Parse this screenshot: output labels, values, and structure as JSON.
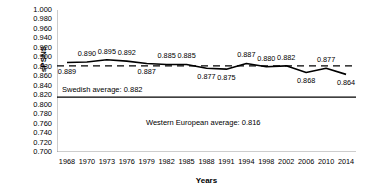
{
  "chart_data": {
    "type": "line",
    "title": "",
    "xlabel": "Years",
    "ylabel": "sPSNS",
    "ylim": [
      0.7,
      1.0
    ],
    "ytick_step": 0.02,
    "grid": false,
    "legend_position": "none",
    "categories": [
      "1968",
      "1970",
      "1973",
      "1976",
      "1979",
      "1982",
      "1985",
      "1988",
      "1991",
      "1994",
      "1998",
      "2002",
      "2006",
      "2010",
      "2014"
    ],
    "series": [
      {
        "name": "sPSNS (Sweden)",
        "style": "solid-black",
        "values": [
          0.889,
          0.89,
          0.895,
          0.892,
          0.887,
          0.885,
          0.885,
          0.877,
          0.875,
          0.887,
          0.88,
          0.882,
          0.868,
          0.877,
          0.864
        ],
        "point_labels": [
          "0.889",
          "0.890",
          "0.895",
          "0.892",
          "0.887",
          "0.885",
          "0.885",
          "0.877",
          "0.875",
          "0.887",
          "0.880",
          "0.882",
          "0.868",
          "0.877",
          "0.864"
        ]
      }
    ],
    "reference_lines": [
      {
        "name": "swedish-average",
        "label": "Swedish average: 0.882",
        "value": 0.882,
        "style": "dashed"
      },
      {
        "name": "western-european-average",
        "label": "Western European average: 0.816",
        "value": 0.816,
        "style": "solid"
      }
    ],
    "ytick_labels": [
      "1.000",
      "0.980",
      "0.960",
      "0.940",
      "0.920",
      "0.900",
      "0.880",
      "0.860",
      "0.840",
      "0.820",
      "0.800",
      "0.780",
      "0.760",
      "0.740",
      "0.720",
      "0.700"
    ],
    "colors": {
      "line": "#000000",
      "axis": "#808080",
      "text": "#000000",
      "background": "#ffffff"
    }
  }
}
